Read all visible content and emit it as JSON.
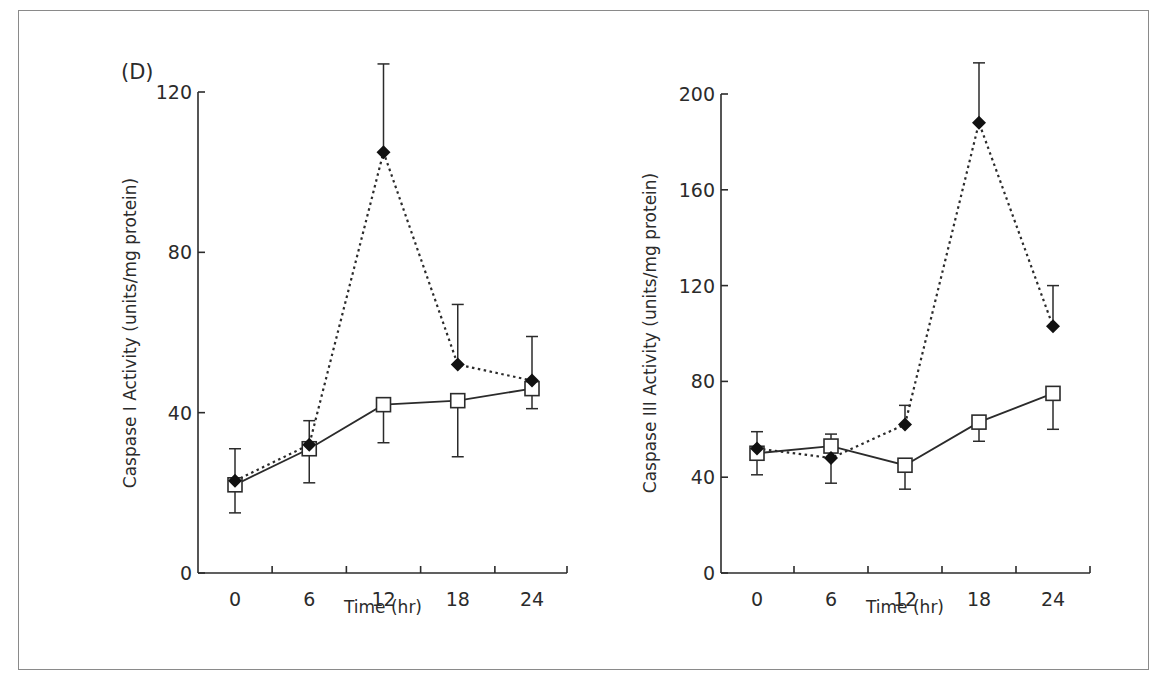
{
  "figure": {
    "panel_label": "(D)",
    "frame_color": "#8a8a8a",
    "ink_color": "#2b2b2b"
  },
  "chart_data": [
    {
      "type": "line",
      "title": "",
      "xlabel": "Time (hr)",
      "ylabel": "Caspase I Activity  (units/mg protein)",
      "x": [
        0,
        6,
        12,
        18,
        24
      ],
      "x_tick_labels": [
        "0",
        "6",
        "12",
        "18",
        "24"
      ],
      "ylim": [
        0,
        120
      ],
      "y_ticks": [
        0,
        40,
        80,
        120
      ],
      "y_tick_labels": [
        "0",
        "40",
        "80",
        "120"
      ],
      "grid": false,
      "legend": "none",
      "series": [
        {
          "name": "filled diamond (dotted line)",
          "marker": "filled-diamond",
          "line_style": "dotted",
          "values": [
            23,
            32,
            105,
            52,
            48
          ],
          "error_upper": [
            31,
            38,
            127,
            67,
            59
          ],
          "error_lower": [
            null,
            null,
            null,
            null,
            null
          ]
        },
        {
          "name": "open square (solid line)",
          "marker": "open-square",
          "line_style": "solid",
          "values": [
            22,
            31,
            42,
            43,
            46
          ],
          "error_upper": [
            null,
            null,
            null,
            null,
            null
          ],
          "error_lower": [
            15,
            22.5,
            32.5,
            29,
            41
          ]
        }
      ]
    },
    {
      "type": "line",
      "title": "",
      "xlabel": "Time (hr)",
      "ylabel": "Caspase III Activity  (units/mg protein)",
      "x": [
        0,
        6,
        12,
        18,
        24
      ],
      "x_tick_labels": [
        "0",
        "6",
        "12",
        "18",
        "24"
      ],
      "ylim": [
        0,
        200
      ],
      "y_ticks": [
        0,
        40,
        80,
        120,
        160,
        200
      ],
      "y_tick_labels": [
        "0",
        "40",
        "80",
        "120",
        "160",
        "200"
      ],
      "grid": false,
      "legend": "none",
      "series": [
        {
          "name": "filled diamond (dotted line)",
          "marker": "filled-diamond",
          "line_style": "dotted",
          "values": [
            52,
            48,
            62,
            188,
            103
          ],
          "error_upper": [
            59,
            null,
            70,
            213,
            120
          ],
          "error_lower": [
            null,
            37.5,
            null,
            null,
            null
          ]
        },
        {
          "name": "open square (solid line)",
          "marker": "open-square",
          "line_style": "solid",
          "values": [
            50,
            53,
            45,
            63,
            75
          ],
          "error_upper": [
            null,
            58,
            null,
            null,
            null
          ],
          "error_lower": [
            41,
            null,
            35,
            55,
            60
          ]
        }
      ]
    }
  ]
}
